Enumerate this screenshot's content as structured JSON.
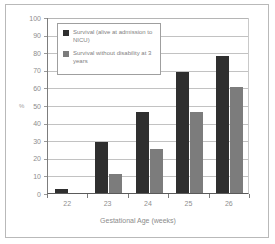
{
  "chart_data": {
    "type": "bar",
    "title": "",
    "subtitle": "",
    "xlabel": "Gestational Age (weeks)",
    "ylabel": "%",
    "categories": [
      "22",
      "23",
      "24",
      "25",
      "26"
    ],
    "series": [
      {
        "name": "Survival (alive at admission to NICU)",
        "name_line1": "Survival (alive at",
        "name_line2": "admission to NICU)",
        "color": "#2f2f2f",
        "values": [
          2,
          29,
          46,
          69,
          78
        ]
      },
      {
        "name": "Survival without disability at 3 years",
        "name_line1": "Survival without disability",
        "name_line2": "at 3 years",
        "color": "#7c7c7c",
        "values": [
          0,
          11,
          25,
          46,
          60
        ]
      }
    ],
    "ylim": [
      0,
      100
    ],
    "ytick_step": 10,
    "yticks": [
      "0",
      "10",
      "20",
      "30",
      "40",
      "50",
      "60",
      "70",
      "80",
      "90",
      "100"
    ],
    "grid": true,
    "grid_axis": "y",
    "legend_position": "upper-left-inside",
    "frame": true
  },
  "figure": {
    "border_color": "#b9b9b9",
    "background": "#ffffff",
    "gridline_color": "#c2c2c2",
    "axis_color": "#7d7d7d",
    "tick_label_color": "#8d8d8d"
  }
}
